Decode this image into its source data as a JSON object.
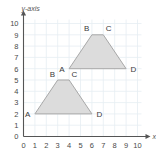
{
  "figure": {
    "background_color": "#ffffff",
    "grid_color": "#e6eef2",
    "axis_color": "#555555",
    "shape_fill": "#dcdcdc",
    "shape_stroke": "#a8a8a8",
    "label_color": "#3a3a3a"
  },
  "axes": {
    "x_title": "x-axis",
    "y_title": "y-axis",
    "x_ticks": [
      "0",
      "1",
      "2",
      "3",
      "4",
      "5",
      "6",
      "7",
      "8",
      "9",
      "10"
    ],
    "y_ticks": [
      "0",
      "1",
      "2",
      "3",
      "4",
      "5",
      "6",
      "7",
      "8",
      "9",
      "10"
    ],
    "xlim": [
      0,
      10
    ],
    "ylim": [
      0,
      10
    ],
    "grid": true
  },
  "chart_data": {
    "type": "scatter",
    "xlabel": "x-axis",
    "ylabel": "y-axis",
    "xlim": [
      0,
      10
    ],
    "ylim": [
      0,
      10
    ],
    "x_ticks": [
      0,
      1,
      2,
      3,
      4,
      5,
      6,
      7,
      8,
      9,
      10
    ],
    "y_ticks": [
      0,
      1,
      2,
      3,
      4,
      5,
      6,
      7,
      8,
      9,
      10
    ],
    "grid": true,
    "legend": "none",
    "series": [
      {
        "name": "lower-trapezoid",
        "closed": true,
        "fill": "#dcdcdc",
        "stroke": "#a8a8a8",
        "points": [
          {
            "label": "A",
            "x": 1,
            "y": 2,
            "label_pos": "left"
          },
          {
            "label": "B",
            "x": 3,
            "y": 5,
            "label_pos": "above-left"
          },
          {
            "label": "C",
            "x": 4,
            "y": 5,
            "label_pos": "above-right"
          },
          {
            "label": "D",
            "x": 6,
            "y": 2,
            "label_pos": "right"
          }
        ]
      },
      {
        "name": "upper-trapezoid",
        "closed": true,
        "fill": "#dcdcdc",
        "stroke": "#a8a8a8",
        "points": [
          {
            "label": "A",
            "x": 4,
            "y": 6,
            "label_pos": "left"
          },
          {
            "label": "B",
            "x": 6,
            "y": 9,
            "label_pos": "above-left"
          },
          {
            "label": "C",
            "x": 7,
            "y": 9,
            "label_pos": "above-right"
          },
          {
            "label": "D",
            "x": 9,
            "y": 6,
            "label_pos": "right"
          }
        ]
      }
    ],
    "annotations": [
      {
        "text": "A",
        "x": 1,
        "y": 2
      },
      {
        "text": "B",
        "x": 3,
        "y": 5
      },
      {
        "text": "C",
        "x": 4,
        "y": 5
      },
      {
        "text": "D",
        "x": 6,
        "y": 2
      },
      {
        "text": "A",
        "x": 4,
        "y": 6
      },
      {
        "text": "B",
        "x": 6,
        "y": 9
      },
      {
        "text": "C",
        "x": 7,
        "y": 9
      },
      {
        "text": "D",
        "x": 9,
        "y": 6
      }
    ]
  }
}
